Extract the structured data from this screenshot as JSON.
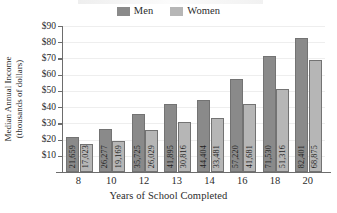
{
  "chart_data": {
    "type": "bar",
    "title": "",
    "xlabel": "Years of School Completed",
    "ylabel_line1": "Median Annual Income",
    "ylabel_line2": "(thousands of dollars)",
    "categories": [
      "8",
      "10",
      "12",
      "13",
      "14",
      "16",
      "18",
      "20"
    ],
    "ylim": [
      0,
      90
    ],
    "yticks": [
      10,
      20,
      30,
      40,
      50,
      60,
      70,
      80,
      90
    ],
    "ytick_labels": [
      "$10",
      "$20",
      "$30",
      "$40",
      "$50",
      "$60",
      "$70",
      "$80",
      "$90"
    ],
    "grid": true,
    "legend_position": "top-center",
    "series": [
      {
        "name": "Men",
        "color": "#8a8a8a",
        "values": [
          21659,
          26277,
          35725,
          41895,
          44404,
          57220,
          71530,
          82401
        ],
        "labels": [
          "21,659",
          "26,277",
          "35,725",
          "41,895",
          "44,404",
          "57,220",
          "71,530",
          "82,401"
        ]
      },
      {
        "name": "Women",
        "color": "#b6b6b6",
        "values": [
          17023,
          19169,
          26029,
          30816,
          33481,
          41681,
          51316,
          68875
        ],
        "labels": [
          "17,023",
          "19,169",
          "26,029",
          "30,816",
          "33,481",
          "41,681",
          "51,316",
          "68,875"
        ]
      }
    ]
  },
  "legend": {
    "men_label": "Men",
    "women_label": "Women"
  },
  "colors": {
    "men": "#8a8a8a",
    "women": "#b6b6b6",
    "axis": "#6d6d6d",
    "grid": "#eeeeee",
    "text": "#2b2b2b"
  }
}
